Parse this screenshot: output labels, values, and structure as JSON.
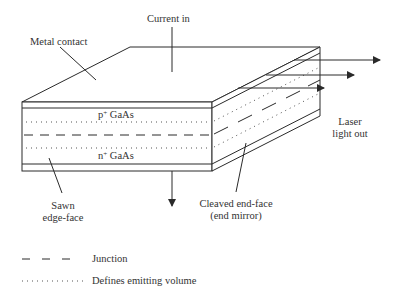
{
  "diagram": {
    "labels": {
      "current_in": "Current in",
      "metal_contact": "Metal contact",
      "p_layer_prefix": "p",
      "p_layer_sup": "+",
      "p_layer_suffix": " GaAs",
      "n_layer_prefix": "n",
      "n_layer_sup": "+",
      "n_layer_suffix": " GaAs",
      "laser_out_line1": "Laser",
      "laser_out_line2": "light out",
      "sawn_line1": "Sawn",
      "sawn_line2": "edge-face",
      "cleaved_line1": "Cleaved end-face",
      "cleaved_line2": "(end mirror)"
    },
    "legend": [
      {
        "style": "dashed",
        "label": "Junction"
      },
      {
        "style": "dotted",
        "label": "Defines emitting volume"
      }
    ],
    "colors": {
      "stroke": "#2a2a2a",
      "text": "#333333",
      "background": "#ffffff"
    }
  }
}
